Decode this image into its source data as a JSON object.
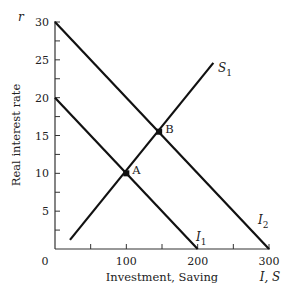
{
  "chart_data": {
    "type": "line",
    "title": "",
    "xlabel": "Investment, Saving",
    "ylabel": "Real interest rate",
    "x_axis_symbol": "I, S",
    "y_axis_symbol": "r",
    "xlim": [
      0,
      300
    ],
    "ylim": [
      0,
      30
    ],
    "x_ticks": [
      0,
      50,
      100,
      150,
      200,
      250,
      300
    ],
    "x_tick_labels": [
      "0",
      "",
      "100",
      "",
      "200",
      "",
      "300"
    ],
    "y_ticks": [
      0,
      2.5,
      5,
      7.5,
      10,
      12.5,
      15,
      17.5,
      20,
      22.5,
      25,
      27.5,
      30
    ],
    "y_tick_labels": [
      "",
      "",
      "5",
      "",
      "10",
      "",
      "15",
      "",
      "20",
      "",
      "25",
      "",
      "30"
    ],
    "grid": false,
    "legend": "none (curves labeled inline)",
    "series": [
      {
        "name": "I1",
        "label_main": "I",
        "label_sub": "1",
        "points": [
          [
            0,
            20
          ],
          [
            200,
            0
          ]
        ]
      },
      {
        "name": "I2",
        "label_main": "I",
        "label_sub": "2",
        "points": [
          [
            0,
            30
          ],
          [
            300,
            0
          ]
        ]
      },
      {
        "name": "S1",
        "label_main": "S",
        "label_sub": "1",
        "points": [
          [
            21,
            1.2
          ],
          [
            222,
            24.6
          ]
        ]
      }
    ],
    "annotations": [
      {
        "label": "A",
        "x": 100,
        "y": 10,
        "desc": "Intersection of S1 and I1"
      },
      {
        "label": "B",
        "x": 146,
        "y": 15.5,
        "desc": "Intersection of S1 and I2"
      }
    ]
  }
}
